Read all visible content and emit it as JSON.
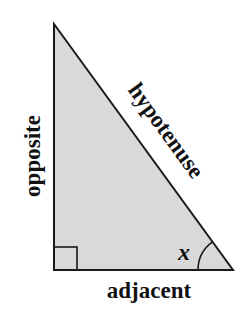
{
  "diagram": {
    "type": "right-triangle",
    "sides": {
      "opposite": "opposite",
      "hypotenuse": "hypotenuse",
      "adjacent": "adjacent"
    },
    "angle_label": "x",
    "right_angle_marker": true,
    "vertices": {
      "top": [
        54,
        24
      ],
      "right_angle": [
        54,
        270
      ],
      "angle_x": [
        233,
        270
      ]
    },
    "colors": {
      "fill": "#d9d9d9",
      "stroke": "#1a1a1a",
      "text": "#111111",
      "background": "#ffffff"
    }
  }
}
